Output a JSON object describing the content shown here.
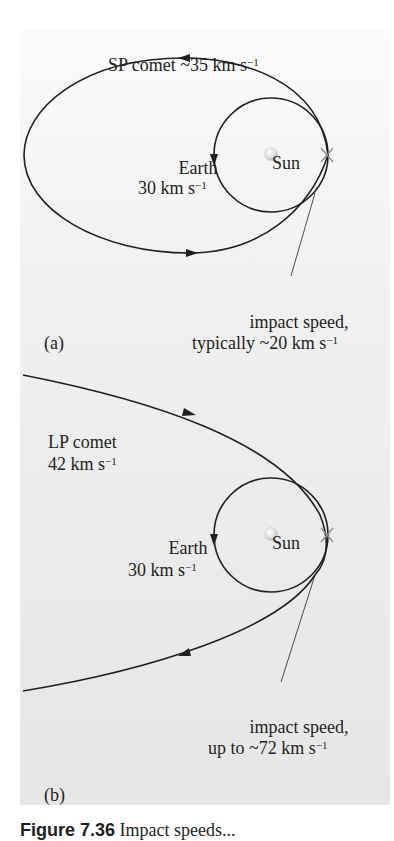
{
  "panels": [
    {
      "id": "a",
      "tag": "(a)",
      "comet_label": "SP comet ~35 km s",
      "comet_exp": "−1",
      "earth_label": "Earth",
      "earth_speed": "30 km s",
      "earth_exp": "−1",
      "sun_label": "Sun",
      "impact_line1": "impact speed,",
      "impact_line2": "typically ~20 km s",
      "impact_exp": "−1"
    },
    {
      "id": "b",
      "tag": "(b)",
      "comet_label": "LP comet",
      "comet_speed": "42 km s",
      "comet_exp": "−1",
      "earth_label": "Earth",
      "earth_speed": "30 km s",
      "earth_exp": "−1",
      "sun_label": "Sun",
      "impact_line1": "impact speed,",
      "impact_line2": "up to ~72 km s",
      "impact_exp": "−1"
    }
  ],
  "caption": {
    "label": "Figure 7.36",
    "text": "Impact speeds..."
  },
  "colors": {
    "ink": "#231f20",
    "sun_fill": "#e8e8e8",
    "panel_bg": "#ececec"
  }
}
